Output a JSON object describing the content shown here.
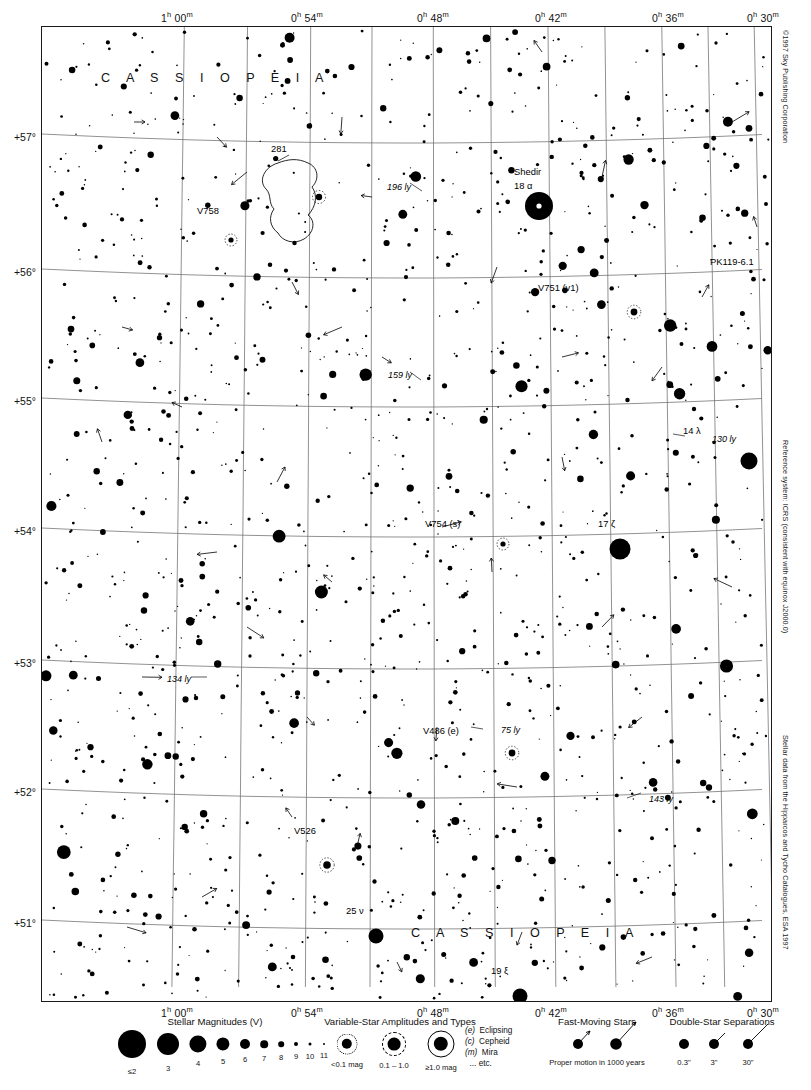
{
  "page": {
    "number": "65",
    "next_page": "85",
    "next_arrow": "▼"
  },
  "credits": [
    {
      "name": "copyright",
      "text": "©1997 Sky Publishing Corporation",
      "top": 30
    },
    {
      "name": "reference-system",
      "text": "Reference system: ICRS (consistent with equinox J2000.0)",
      "top": 440
    },
    {
      "name": "data-source",
      "text": "Stellar data from the Hipparcos and Tycho Catalogues, ESA 1997",
      "top": 735
    }
  ],
  "axes": {
    "ra_ticks": [
      {
        "label": "1h 00m",
        "hours": "1",
        "sup1": "h",
        "minutes": "00",
        "sup2": "m",
        "x": 136
      },
      {
        "label": "0h 54m",
        "hours": "0",
        "sup1": "h",
        "minutes": "54",
        "sup2": "m",
        "x": 266
      },
      {
        "label": "0h 48m",
        "hours": "0",
        "sup1": "h",
        "minutes": "48",
        "sup2": "m",
        "x": 392
      },
      {
        "label": "0h 42m",
        "hours": "0",
        "sup1": "h",
        "minutes": "42",
        "sup2": "m",
        "x": 510
      },
      {
        "label": "0h 36m",
        "hours": "0",
        "sup1": "h",
        "minutes": "36",
        "sup2": "m",
        "x": 627
      },
      {
        "label": "0h 30m",
        "hours": "0",
        "sup1": "h",
        "minutes": "30",
        "sup2": "m",
        "x": 722
      }
    ],
    "dec_ticks": [
      {
        "label": "+57°",
        "y": 111
      },
      {
        "label": "+56°",
        "y": 246
      },
      {
        "label": "+55°",
        "y": 375
      },
      {
        "label": "+54°",
        "y": 505
      },
      {
        "label": "+53°",
        "y": 637
      },
      {
        "label": "+52°",
        "y": 766
      },
      {
        "label": "+51°",
        "y": 897
      }
    ]
  },
  "constellations": [
    {
      "name": "cassiopeia-top",
      "text": "C A S S I O P E I A",
      "x": 60,
      "y": 70
    },
    {
      "name": "cassiopeia-bottom",
      "text": "C A S S I O P E I A",
      "x": 370,
      "y": 925
    }
  ],
  "labels": [
    {
      "name": "label-shedir",
      "text": "Shedir",
      "x": 513,
      "y": 172,
      "style": "plain"
    },
    {
      "name": "label-18-alpha",
      "text": "18 α",
      "x": 513,
      "y": 186,
      "style": "plain"
    },
    {
      "name": "label-v758",
      "text": "V758",
      "x": 196,
      "y": 211,
      "style": "plain"
    },
    {
      "name": "label-ic281",
      "text": "281",
      "x": 270,
      "y": 149,
      "style": "plain"
    },
    {
      "name": "label-196ly",
      "text": "196 ly",
      "x": 386,
      "y": 188,
      "style": "ly"
    },
    {
      "name": "label-pk119",
      "text": "PK119-6.1",
      "x": 709,
      "y": 262,
      "style": "plain"
    },
    {
      "name": "label-v751",
      "text": "V751 (v1)",
      "x": 537,
      "y": 288,
      "style": "plain"
    },
    {
      "name": "label-159ly",
      "text": "159 ly",
      "x": 387,
      "y": 376,
      "style": "ly"
    },
    {
      "name": "label-14-lambda",
      "text": "14 λ",
      "x": 682,
      "y": 431,
      "style": "plain"
    },
    {
      "name": "label-130ly",
      "text": "130 ly",
      "x": 711,
      "y": 440,
      "style": "ly"
    },
    {
      "name": "label-v754",
      "text": "V754 (s)",
      "x": 424,
      "y": 524,
      "style": "plain"
    },
    {
      "name": "label-17-zeta",
      "text": "17 ζ",
      "x": 597,
      "y": 524,
      "style": "plain"
    },
    {
      "name": "label-134ly",
      "text": "134 ly",
      "x": 166,
      "y": 680,
      "style": "ly"
    },
    {
      "name": "label-v486",
      "text": "V486 (e)",
      "x": 422,
      "y": 731,
      "style": "plain"
    },
    {
      "name": "label-75ly",
      "text": "75 ly",
      "x": 500,
      "y": 731,
      "style": "ly"
    },
    {
      "name": "label-143ly",
      "text": "143 ly",
      "x": 648,
      "y": 800,
      "style": "ly"
    },
    {
      "name": "label-v526",
      "text": "V526",
      "x": 293,
      "y": 831,
      "style": "plain"
    },
    {
      "name": "label-25-nu",
      "text": "25 ν",
      "x": 345,
      "y": 911,
      "style": "plain"
    },
    {
      "name": "label-19-xi",
      "text": "19 ξ",
      "x": 490,
      "y": 971,
      "style": "plain"
    }
  ],
  "legend": {
    "magnitudes": {
      "title": "Stellar Magnitudes (V)",
      "title_x": 215,
      "items": [
        {
          "label": "≤2",
          "x": 132,
          "r": 14.0
        },
        {
          "label": "3",
          "x": 168,
          "r": 11.0
        },
        {
          "label": "4",
          "x": 198,
          "r": 8.6
        },
        {
          "label": "5",
          "x": 223,
          "r": 6.6
        },
        {
          "label": "6",
          "x": 245,
          "r": 5.0
        },
        {
          "label": "7",
          "x": 264,
          "r": 3.8
        },
        {
          "label": "8",
          "x": 281,
          "r": 2.8
        },
        {
          "label": "9",
          "x": 296,
          "r": 2.0
        },
        {
          "label": "10",
          "x": 310,
          "r": 1.5
        },
        {
          "label": "11",
          "x": 324,
          "r": 1.0
        }
      ]
    },
    "variables": {
      "title": "Variable-Star Amplitudes and Types",
      "title_x": 400,
      "items": [
        {
          "label": "<0.1 mag",
          "x": 347,
          "r": 5.2,
          "ring": 9.5,
          "ring_style": "dotted"
        },
        {
          "label": "0.1 – 1.0",
          "x": 394,
          "r": 6.4,
          "ring": 11.0,
          "ring_style": "dashed"
        },
        {
          "label": "≥1.0 mag",
          "x": 441,
          "r": 7.2,
          "ring": 12.5,
          "ring_style": "solid"
        }
      ],
      "types": [
        {
          "code": "(e)",
          "name": "Eclipsing"
        },
        {
          "code": "(c)",
          "name": "Cepheid"
        },
        {
          "code": "(m)",
          "name": "Mira"
        },
        {
          "code": "",
          "name": "... etc."
        }
      ]
    },
    "fast_moving": {
      "title": "Fast-Moving Stars",
      "title_x": 597,
      "caption": "Proper motion in 1000 years",
      "items": [
        {
          "x": 578,
          "r": 5.0,
          "vx": 12,
          "vy": -13
        },
        {
          "x": 616,
          "r": 5.8,
          "vx": 20,
          "vy": -22
        }
      ]
    },
    "doubles": {
      "title": "Double-Star Separations",
      "title_x": 722,
      "items": [
        {
          "label": "0.3\"",
          "x": 684,
          "r": 5.0,
          "sep": 0
        },
        {
          "label": "3\"",
          "x": 714,
          "r": 5.0,
          "sep": 11
        },
        {
          "label": "30\"",
          "x": 748,
          "r": 5.0,
          "sep": 20
        }
      ]
    }
  },
  "chart_data": {
    "type": "scatter",
    "xlabel": "Right Ascension",
    "ylabel": "Declination",
    "xlim": [
      "1h 03m",
      "0h 27m"
    ],
    "ylim": [
      "+50.3°",
      "+57.6°"
    ],
    "grid": true,
    "named_objects": [
      {
        "name": "Shedir",
        "designation": "18 α Cas",
        "ra": "0h 40.5m",
        "dec": "+56.5°",
        "magnitude": 2.2,
        "x": 497,
        "y": 179,
        "radius": 14
      },
      {
        "name": "17 ζ Cas",
        "designation": "17 ζ",
        "ra": "0h 37m",
        "dec": "+53.9°",
        "magnitude": 3.7,
        "x": 578,
        "y": 522,
        "radius": 10.5
      },
      {
        "name": "14 λ Cas",
        "designation": "14 λ",
        "ra": "0h 31.8m",
        "dec": "+54.5°",
        "magnitude": 4.7,
        "x": 707,
        "y": 434,
        "radius": 8.5
      },
      {
        "name": "25 ν Cas",
        "designation": "25 ν",
        "ra": "0h 48.5m",
        "dec": "+50.9°",
        "magnitude": 4.9,
        "x": 334,
        "y": 909,
        "radius": 7.5
      },
      {
        "name": "19 ξ Cas",
        "designation": "19 ξ",
        "ra": "0h 42.9m",
        "dec": "+50.5°",
        "magnitude": 4.8,
        "x": 478,
        "y": 969,
        "radius": 7.5
      },
      {
        "name": "V751 Cas",
        "designation": "V751 (v1)",
        "ra": "0h 36.5m",
        "dec": "+56.0°",
        "magnitude": 8.0,
        "x": 592,
        "y": 285,
        "radius": 3.4
      },
      {
        "name": "V754 Cas",
        "designation": "V754 (s)",
        "ra": "0h 45m",
        "dec": "+54.0°",
        "magnitude": 8.5,
        "x": 461,
        "y": 517,
        "radius": 2.6
      },
      {
        "name": "V486 Cas",
        "designation": "V486 (e)",
        "ra": "0h 44m",
        "dec": "+52.2°",
        "magnitude": 8.0,
        "x": 470,
        "y": 726,
        "radius": 3.4
      },
      {
        "name": "V526 Cas",
        "designation": "V526",
        "ra": "0h 51m",
        "dec": "+51.2°",
        "magnitude": 7.5,
        "x": 285,
        "y": 838,
        "radius": 3.8
      },
      {
        "name": "V758 Cas",
        "designation": "V758",
        "ra": "0h 57m",
        "dec": "+56.2°",
        "magnitude": 8.0,
        "x": 189,
        "y": 213,
        "radius": 2.6
      },
      {
        "name": "PK 119-6.1",
        "designation": "PK119-6.1",
        "ra": "0h 30m",
        "dec": "+56.1°",
        "magnitude": 12.0,
        "x": 762,
        "y": 245,
        "radius": 0
      },
      {
        "name": "IC 281",
        "designation": "281",
        "ra": "0h 57m",
        "dec": "+56.6°",
        "magnitude": 0,
        "x": 277,
        "y": 170,
        "radius": 0
      }
    ],
    "distance_annotations": [
      {
        "label": "196 ly",
        "x": 386,
        "y": 188
      },
      {
        "label": "159 ly",
        "x": 387,
        "y": 376
      },
      {
        "label": "130 ly",
        "x": 711,
        "y": 440
      },
      {
        "label": "134 ly",
        "x": 166,
        "y": 680
      },
      {
        "label": "75 ly",
        "x": 500,
        "y": 731
      },
      {
        "label": "143 ly",
        "x": 648,
        "y": 800
      }
    ]
  }
}
